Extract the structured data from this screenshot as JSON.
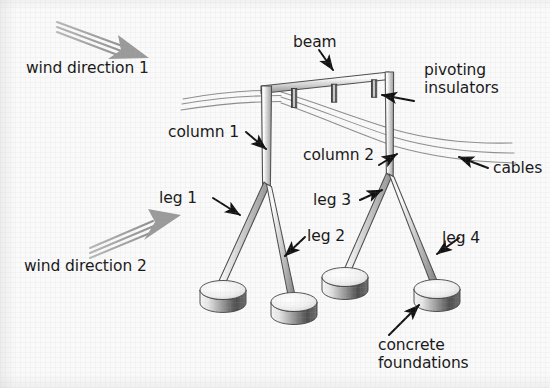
{
  "figure": {
    "background_color": "#fbfafa",
    "text_color": "#161616",
    "steel_color": "#cfcfcf",
    "cable_color": "#8a8a8a",
    "wind_arrow_color": "#9a9a9a",
    "leader_arrow_color": "#111111"
  },
  "labels": {
    "wind_direction_1": "wind direction 1",
    "wind_direction_2": "wind direction 2",
    "beam": "beam",
    "pivoting_insulators_line1": "pivoting",
    "pivoting_insulators_line2": "insulators",
    "cables": "cables",
    "column_1": "column 1",
    "column_2": "column 2",
    "leg_1": "leg 1",
    "leg_2": "leg 2",
    "leg_3": "leg 3",
    "leg_4": "leg 4",
    "concrete_foundations_line1": "concrete",
    "concrete_foundations_line2": "foundations"
  },
  "structure": {
    "columns": 2,
    "legs": 4,
    "foundations": 4,
    "pivoting_insulators": 3,
    "cables": 3
  },
  "icons": {
    "wind_arrow_1": "wind-arrow-down-right-icon",
    "wind_arrow_2": "wind-arrow-up-right-icon",
    "leader_arrow": "leader-arrow-icon"
  }
}
